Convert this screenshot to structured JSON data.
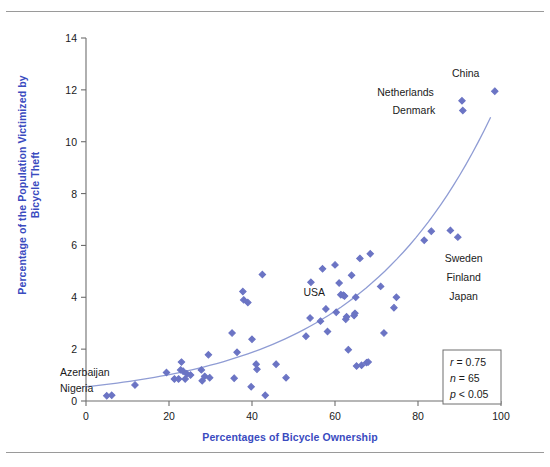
{
  "chart_data": {
    "type": "scatter",
    "title": "",
    "xlabel": "Percentages of Bicycle Ownership",
    "ylabel": "Percentage of the Population Victimized by Bicycle Theft",
    "xlim": [
      0,
      100
    ],
    "ylim": [
      0,
      14
    ],
    "xticks": [
      0,
      20,
      40,
      60,
      80,
      100
    ],
    "yticks": [
      0,
      2,
      4,
      6,
      8,
      10,
      12,
      14
    ],
    "grid": false,
    "legend": "none",
    "marker": "diamond",
    "marker_color": "#6b74c4",
    "trend_color": "#8f9cd4",
    "trendline": "exponential fit curve rising from ~0.55 at x=0 to ~11.2 at x=98",
    "points": [
      {
        "x": 5.0,
        "y": 0.2
      },
      {
        "x": 6.2,
        "y": 0.22
      },
      {
        "x": 11.8,
        "y": 0.62
      },
      {
        "x": 19.4,
        "y": 1.1
      },
      {
        "x": 21.3,
        "y": 0.85
      },
      {
        "x": 22.3,
        "y": 0.85
      },
      {
        "x": 22.8,
        "y": 1.2
      },
      {
        "x": 23.0,
        "y": 1.5
      },
      {
        "x": 23.4,
        "y": 1.15
      },
      {
        "x": 23.9,
        "y": 0.85
      },
      {
        "x": 24.3,
        "y": 1.05
      },
      {
        "x": 25.2,
        "y": 1.0
      },
      {
        "x": 27.8,
        "y": 1.2
      },
      {
        "x": 28.0,
        "y": 0.78
      },
      {
        "x": 28.6,
        "y": 0.95
      },
      {
        "x": 29.5,
        "y": 1.78
      },
      {
        "x": 29.8,
        "y": 0.9
      },
      {
        "x": 35.2,
        "y": 2.62
      },
      {
        "x": 35.7,
        "y": 0.88
      },
      {
        "x": 36.4,
        "y": 1.88
      },
      {
        "x": 37.8,
        "y": 4.22
      },
      {
        "x": 38.0,
        "y": 3.9
      },
      {
        "x": 39.0,
        "y": 3.8
      },
      {
        "x": 39.8,
        "y": 0.55
      },
      {
        "x": 40.0,
        "y": 2.38
      },
      {
        "x": 41.0,
        "y": 1.42
      },
      {
        "x": 41.2,
        "y": 1.22
      },
      {
        "x": 42.5,
        "y": 4.88
      },
      {
        "x": 43.2,
        "y": 0.22
      },
      {
        "x": 45.8,
        "y": 1.42
      },
      {
        "x": 48.2,
        "y": 0.9
      },
      {
        "x": 53.0,
        "y": 2.5
      },
      {
        "x": 54.0,
        "y": 3.2
      },
      {
        "x": 54.2,
        "y": 4.58
      },
      {
        "x": 56.5,
        "y": 3.08
      },
      {
        "x": 57.0,
        "y": 5.1
      },
      {
        "x": 57.8,
        "y": 3.55
      },
      {
        "x": 58.2,
        "y": 2.68
      },
      {
        "x": 60.0,
        "y": 5.25
      },
      {
        "x": 60.3,
        "y": 3.42
      },
      {
        "x": 61.0,
        "y": 4.55
      },
      {
        "x": 61.4,
        "y": 4.1
      },
      {
        "x": 62.0,
        "y": 4.08
      },
      {
        "x": 62.3,
        "y": 4.05
      },
      {
        "x": 62.6,
        "y": 3.15
      },
      {
        "x": 62.8,
        "y": 3.25
      },
      {
        "x": 63.2,
        "y": 1.98
      },
      {
        "x": 64.0,
        "y": 4.85
      },
      {
        "x": 64.6,
        "y": 3.3
      },
      {
        "x": 64.8,
        "y": 3.38
      },
      {
        "x": 65.0,
        "y": 4.0
      },
      {
        "x": 65.2,
        "y": 1.35
      },
      {
        "x": 66.0,
        "y": 5.5
      },
      {
        "x": 66.4,
        "y": 1.38
      },
      {
        "x": 67.6,
        "y": 1.48
      },
      {
        "x": 68.0,
        "y": 1.5
      },
      {
        "x": 68.5,
        "y": 5.68
      },
      {
        "x": 71.0,
        "y": 4.42
      },
      {
        "x": 71.8,
        "y": 2.62
      },
      {
        "x": 74.2,
        "y": 3.6
      },
      {
        "x": 74.8,
        "y": 4.0
      },
      {
        "x": 81.5,
        "y": 6.2
      },
      {
        "x": 83.2,
        "y": 6.55
      },
      {
        "x": 87.8,
        "y": 6.58
      },
      {
        "x": 89.6,
        "y": 6.32
      },
      {
        "x": 90.8,
        "y": 11.2
      },
      {
        "x": 90.6,
        "y": 11.58
      },
      {
        "x": 98.5,
        "y": 11.95
      }
    ],
    "annotations": [
      {
        "label": "China",
        "x": 91.5,
        "y": 12.65
      },
      {
        "label": "Netherlands",
        "x": 77.0,
        "y": 11.9
      },
      {
        "label": "Denmark",
        "x": 79.0,
        "y": 11.22
      },
      {
        "label": "Sweden",
        "x": 91.0,
        "y": 5.52
      },
      {
        "label": "Finland",
        "x": 91.0,
        "y": 4.78
      },
      {
        "label": "Japan",
        "x": 91.0,
        "y": 4.05
      },
      {
        "label": "USA",
        "x": 55.0,
        "y": 4.22
      },
      {
        "label": "Azerbaijan",
        "x": -0.5,
        "y": 1.12
      },
      {
        "label": "Nigeria",
        "x": -0.5,
        "y": 0.52
      }
    ],
    "stats_box": {
      "r_symbol": "r",
      "r_value": "= 0.75",
      "n_symbol": "n",
      "n_value": "= 65",
      "p_symbol": "p",
      "p_value": "< 0.05"
    },
    "tick_labels_x": [
      "0",
      "20",
      "40",
      "60",
      "80",
      "100"
    ],
    "tick_labels_y": [
      "0",
      "2",
      "4",
      "6",
      "8",
      "10",
      "12",
      "14"
    ]
  },
  "colors": {
    "axis_label": "#3a4bbf",
    "marker": "#6b74c4",
    "trend": "#8f9cd4",
    "axis": "#6e6e6e",
    "rule": "#9a9a9a"
  }
}
